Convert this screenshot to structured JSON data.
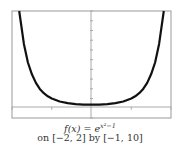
{
  "chart_data": {
    "type": "line",
    "title": "",
    "function": "f(x) = e^(x^2 - 1)",
    "xlabel": "",
    "ylabel": "",
    "xlim": [
      -2,
      2
    ],
    "ylim": [
      -1,
      10
    ],
    "x_ticks_step": 1,
    "y_ticks_step": 1,
    "grid": false,
    "series": [
      {
        "name": "f(x)",
        "x": [
          -1.82,
          -1.7,
          -1.6,
          -1.5,
          -1.4,
          -1.3,
          -1.2,
          -1.1,
          -1.0,
          -0.8,
          -0.6,
          -0.4,
          -0.2,
          0,
          0.2,
          0.4,
          0.6,
          0.8,
          1.0,
          1.1,
          1.2,
          1.3,
          1.4,
          1.5,
          1.6,
          1.7,
          1.82
        ],
        "y": [
          10.0,
          6.62,
          4.71,
          3.49,
          2.61,
          1.99,
          1.55,
          1.23,
          1.0,
          0.7,
          0.53,
          0.43,
          0.38,
          0.37,
          0.38,
          0.43,
          0.53,
          0.7,
          1.0,
          1.23,
          1.55,
          1.99,
          2.61,
          3.49,
          4.71,
          6.62,
          10.0
        ]
      }
    ],
    "colors": {
      "curve": "#111111",
      "frame": "#999999",
      "axis": "#aaaaaa"
    }
  },
  "caption": {
    "function_prefix": "f(x) = e",
    "exponent": "x²−1",
    "window": "on [−2, 2] by [−1, 10]"
  }
}
